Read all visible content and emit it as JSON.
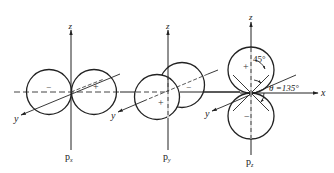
{
  "diagram": {
    "panels": [
      {
        "id": "px",
        "label_main": "p",
        "label_sub": "x",
        "axes": {
          "z": "z",
          "y": "y"
        },
        "lobes": [
          {
            "sign": "−",
            "position": "left"
          },
          {
            "sign": "+",
            "position": "right"
          }
        ]
      },
      {
        "id": "py",
        "label_main": "p",
        "label_sub": "y",
        "axes": {
          "z": "z",
          "y": "y"
        },
        "lobes": [
          {
            "sign": "+",
            "position": "front"
          },
          {
            "sign": "−",
            "position": "back"
          }
        ]
      },
      {
        "id": "pz",
        "label_main": "p",
        "label_sub": "z",
        "axes": {
          "z": "z",
          "x": "x"
        },
        "lobes": [
          {
            "sign": "+",
            "position": "top"
          },
          {
            "sign": "−",
            "position": "bottom"
          }
        ],
        "annotations": {
          "angle_45": "45°",
          "theta_label": "θ =135°"
        }
      }
    ],
    "colors": {
      "line": "#222222",
      "dashed": "#444444",
      "background": "#ffffff"
    }
  }
}
